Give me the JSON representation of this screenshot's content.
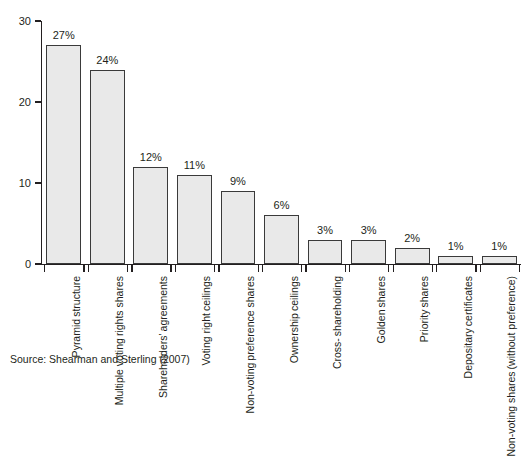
{
  "chart_data": {
    "type": "bar",
    "title": "",
    "xlabel": "",
    "ylabel": "% of CEM occurences",
    "ylim": [
      0,
      30
    ],
    "yticks": [
      0,
      10,
      20,
      30
    ],
    "ytick_labels": [
      "0",
      "10",
      "20",
      "30"
    ],
    "grid": false,
    "legend": "none",
    "value_suffix": "%",
    "categories": [
      "Pyramid structure",
      "Multiple voting rights shares",
      "Shareholders' agreements",
      "Voting right ceilings",
      "Non-voting preference shares",
      "Ownership ceilings",
      "Cross-shareholding",
      "Golden shares",
      "Priority shares",
      "Depositary certificates",
      "Non-voting shares (without preference)"
    ],
    "category_lines": [
      [
        "Pyramid",
        "structure"
      ],
      [
        "Multiple voting",
        "rights shares"
      ],
      [
        "Shareholders'",
        "agreements"
      ],
      [
        "Voting right",
        "ceilings"
      ],
      [
        "Non-voting",
        "preference shares"
      ],
      [
        "Ownership",
        "ceilings"
      ],
      [
        "Cross-",
        "shareholding"
      ],
      [
        "Golden",
        "shares"
      ],
      [
        "Priority",
        "shares"
      ],
      [
        "Depositary",
        "certificates"
      ],
      [
        "Non-voting shares",
        "(without preference)"
      ]
    ],
    "values": [
      27,
      24,
      12,
      11,
      9,
      6,
      3,
      3,
      2,
      1,
      1
    ],
    "value_labels": [
      "27%",
      "24%",
      "12%",
      "11%",
      "9%",
      "6%",
      "3%",
      "3%",
      "2%",
      "1%",
      "1%"
    ],
    "colors": {
      "bar_fill": "#e9e9e9",
      "bar_border": "#3a3a3a",
      "axis": "#231f20",
      "text": "#231f20",
      "background": "#ffffff"
    }
  },
  "source": {
    "note": "Source: Shearman and Sterling (2007)"
  },
  "caption": {
    "ghost_text": ""
  }
}
